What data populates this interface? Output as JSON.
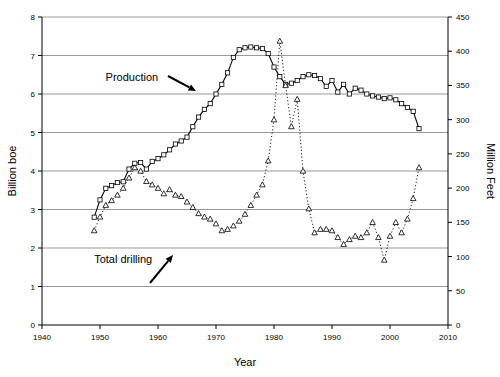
{
  "chart_data": {
    "type": "line",
    "title": "",
    "xlabel": "Year",
    "ylabel": "Billion boe",
    "y2label": "Million Feet",
    "xlim": [
      1940,
      2010
    ],
    "ylim": [
      0,
      8
    ],
    "y2lim": [
      0,
      450
    ],
    "xticks": [
      1940,
      1950,
      1960,
      1970,
      1980,
      1990,
      2000,
      2010
    ],
    "yticks": [
      0,
      1,
      2,
      3,
      4,
      5,
      6,
      7,
      8
    ],
    "y2ticks": [
      0,
      50,
      100,
      150,
      200,
      250,
      300,
      350,
      400,
      450
    ],
    "grid": "horizontal",
    "legend_position": "inline-annotations",
    "annotations": [
      {
        "text": "Production",
        "x": 1955.5,
        "y": 6.35,
        "arrow": "down-right"
      },
      {
        "text": "Total drilling",
        "x": 1954.0,
        "y": 1.62,
        "arrow": "up-right"
      }
    ],
    "series": [
      {
        "name": "Production",
        "axis": "left",
        "units": "Billion boe",
        "marker": "square",
        "line": "solid",
        "x": [
          1949,
          1950,
          1951,
          1952,
          1953,
          1954,
          1955,
          1956,
          1957,
          1958,
          1959,
          1960,
          1961,
          1962,
          1963,
          1964,
          1965,
          1966,
          1967,
          1968,
          1969,
          1970,
          1971,
          1972,
          1973,
          1974,
          1975,
          1976,
          1977,
          1978,
          1979,
          1980,
          1981,
          1982,
          1983,
          1984,
          1985,
          1986,
          1987,
          1988,
          1989,
          1990,
          1991,
          1992,
          1993,
          1994,
          1995,
          1996,
          1997,
          1998,
          1999,
          2000,
          2001,
          2002,
          2003,
          2004,
          2005
        ],
        "values": [
          2.8,
          3.25,
          3.55,
          3.62,
          3.7,
          3.72,
          4.05,
          4.2,
          4.22,
          4.05,
          4.25,
          4.32,
          4.42,
          4.55,
          4.7,
          4.78,
          4.88,
          5.15,
          5.4,
          5.6,
          5.75,
          6.0,
          6.25,
          6.55,
          6.95,
          7.15,
          7.2,
          7.22,
          7.2,
          7.18,
          7.05,
          6.7,
          6.45,
          6.25,
          6.28,
          6.35,
          6.45,
          6.5,
          6.48,
          6.4,
          6.2,
          6.35,
          6.05,
          6.25,
          6.0,
          6.15,
          6.1,
          6.0,
          5.95,
          5.92,
          5.88,
          5.9,
          5.85,
          5.75,
          5.65,
          5.55,
          5.1
        ]
      },
      {
        "name": "Total drilling",
        "axis": "right",
        "units": "Million Feet",
        "marker": "triangle",
        "line": "dotted",
        "x": [
          1949,
          1950,
          1951,
          1952,
          1953,
          1954,
          1955,
          1956,
          1957,
          1958,
          1959,
          1960,
          1961,
          1962,
          1963,
          1964,
          1965,
          1966,
          1967,
          1968,
          1969,
          1970,
          1971,
          1972,
          1973,
          1974,
          1975,
          1976,
          1977,
          1978,
          1979,
          1980,
          1981,
          1982,
          1983,
          1984,
          1985,
          1986,
          1987,
          1988,
          1989,
          1990,
          1991,
          1992,
          1993,
          1994,
          1995,
          1996,
          1997,
          1998,
          1999,
          2000,
          2001,
          2002,
          2003,
          2004,
          2005
        ],
        "values": [
          138,
          158,
          175,
          182,
          190,
          200,
          215,
          230,
          225,
          210,
          205,
          200,
          192,
          198,
          190,
          188,
          180,
          172,
          163,
          158,
          155,
          148,
          138,
          140,
          145,
          152,
          162,
          175,
          190,
          205,
          240,
          300,
          415,
          350,
          290,
          330,
          225,
          170,
          135,
          140,
          140,
          138,
          128,
          118,
          125,
          130,
          128,
          135,
          150,
          128,
          95,
          130,
          150,
          135,
          155,
          185,
          230
        ]
      }
    ]
  },
  "axes": {
    "x_title": "Year",
    "y_left_title": "Billion boe",
    "y_right_title": "Million Feet",
    "x_tick_labels": [
      "1940",
      "1950",
      "1960",
      "1970",
      "1980",
      "1990",
      "2000",
      "2010"
    ],
    "y_left_tick_labels": [
      "0",
      "1",
      "2",
      "3",
      "4",
      "5",
      "6",
      "7",
      "8"
    ],
    "y_right_tick_labels": [
      "0",
      "50",
      "100",
      "150",
      "200",
      "250",
      "300",
      "350",
      "400",
      "450"
    ]
  },
  "annotations": {
    "production_label": "Production",
    "drilling_label": "Total drilling"
  },
  "colors": {
    "background": "#ffffff",
    "axis": "#000000",
    "grid": "#808080",
    "production": "#000000",
    "drilling": "#000000"
  }
}
